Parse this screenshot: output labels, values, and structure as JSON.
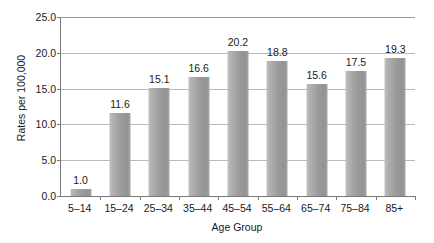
{
  "chart_data": {
    "type": "bar",
    "title": "",
    "xlabel": "Age Group",
    "ylabel": "Rates per 100,000",
    "categories": [
      "5–14",
      "15–24",
      "25–34",
      "35–44",
      "45–54",
      "55–64",
      "65–74",
      "75–84",
      "85+"
    ],
    "values": [
      1.0,
      11.6,
      15.1,
      16.6,
      20.2,
      18.8,
      15.6,
      17.5,
      19.3
    ],
    "data_labels": [
      "1.0",
      "11.6",
      "15.1",
      "16.6",
      "20.2",
      "18.8",
      "15.6",
      "17.5",
      "19.3"
    ],
    "ylim": [
      0.0,
      25.0
    ],
    "ytick_values": [
      0.0,
      5.0,
      10.0,
      15.0,
      20.0,
      25.0
    ],
    "ytick_labels": [
      "0.0",
      "5.0",
      "10.0",
      "15.0",
      "20.0",
      "25.0"
    ],
    "grid": true,
    "legend": false,
    "legend_position": "none",
    "bar_color": "#9b9b9b",
    "gridline_color": "#b9b9b9",
    "axis_color": "#7a7a7a",
    "text_color": "#1a1a1a",
    "background_color": "#ffffff"
  }
}
